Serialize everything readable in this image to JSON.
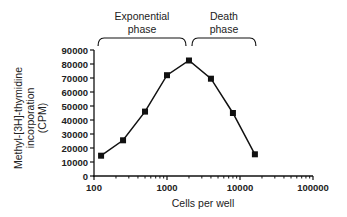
{
  "chart_data": {
    "type": "line",
    "title": "",
    "xlabel": "Cells per well",
    "ylabel": "Methyl-[3H]-thymidine incorporation (CPM)",
    "ylabel_lines": [
      "Methyl-[3H]-thymidine",
      "incorporation",
      "(CPM)"
    ],
    "xscale": "log",
    "xlim": [
      100,
      100000
    ],
    "ylim": [
      0,
      90000
    ],
    "x_ticks": [
      100,
      1000,
      10000,
      100000
    ],
    "x_tick_labels": [
      "100",
      "1000",
      "10000",
      "100000"
    ],
    "y_ticks": [
      0,
      10000,
      20000,
      30000,
      40000,
      50000,
      60000,
      70000,
      80000,
      90000
    ],
    "y_tick_labels": [
      "0",
      "10000",
      "20000",
      "30000",
      "40000",
      "50000",
      "60000",
      "70000",
      "80000",
      "90000"
    ],
    "grid": false,
    "legend": null,
    "marker": "square",
    "series": [
      {
        "name": "Thymidine incorporation",
        "x": [
          125,
          250,
          500,
          1000,
          2000,
          4000,
          8000,
          16000
        ],
        "values": [
          14500,
          25500,
          46000,
          72000,
          82500,
          69500,
          45000,
          15500
        ]
      }
    ],
    "annotations": [
      {
        "label_lines": [
          "Exponential",
          "phase"
        ],
        "x_range": [
          125,
          2000
        ],
        "type": "bracket"
      },
      {
        "label_lines": [
          "Death",
          "phase"
        ],
        "x_range": [
          2000,
          16000
        ],
        "type": "bracket"
      }
    ]
  },
  "colors": {
    "line": "#111111",
    "axis": "#111111",
    "text": "#222222"
  }
}
